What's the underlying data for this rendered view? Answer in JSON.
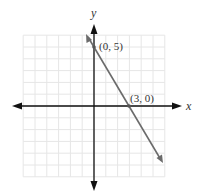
{
  "axes": {
    "x_label": "x",
    "y_label": "y",
    "x_range": [
      -6,
      6
    ],
    "y_range": [
      -6,
      6
    ]
  },
  "line": {
    "equation": "y = -5/3 x + 5",
    "points": [
      {
        "label": "(0, 5)",
        "x": 0,
        "y": 5
      },
      {
        "label": "(3, 0)",
        "x": 3,
        "y": 0
      }
    ]
  },
  "colors": {
    "line": "#6b6b6b",
    "axes": "#111111",
    "grid": "#e4e4e4"
  }
}
